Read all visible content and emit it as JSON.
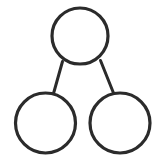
{
  "figure": {
    "background_color": "#ffffff",
    "width": 167,
    "height": 164
  },
  "style": {
    "stroke_color": "#2b2b2b",
    "node_stroke_width": 3.2,
    "link_stroke_width": 3.0,
    "node_fill": "none"
  },
  "chart_data": {
    "type": "diagram",
    "subtitle": "",
    "orientation": "top-down",
    "node_count": 3,
    "link_count": 2,
    "nodes": [
      {
        "id": "top",
        "label": "",
        "role": "whole",
        "cx": 80,
        "cy": 36,
        "r": 28,
        "stroke": "#2b2b2b",
        "fill": "none"
      },
      {
        "id": "bottom-left",
        "label": "",
        "role": "part",
        "cx": 45.5,
        "cy": 123,
        "r": 30,
        "stroke": "#2b2b2b",
        "fill": "none"
      },
      {
        "id": "bottom-right",
        "label": "",
        "role": "part",
        "cx": 120,
        "cy": 123,
        "r": 30,
        "stroke": "#2b2b2b",
        "fill": "none"
      }
    ],
    "links": [
      {
        "id": "link-left",
        "from": "top",
        "to": "bottom-left",
        "x1": 62.5,
        "y1": 61.5,
        "x2": 53.5,
        "y2": 93.5,
        "stroke": "#2b2b2b"
      },
      {
        "id": "link-right",
        "from": "top",
        "to": "bottom-right",
        "x1": 100.5,
        "y1": 60.5,
        "x2": 113.5,
        "y2": 93.0,
        "stroke": "#2b2b2b"
      }
    ],
    "labels": [],
    "annotations": [],
    "legend": null,
    "grid": false
  }
}
